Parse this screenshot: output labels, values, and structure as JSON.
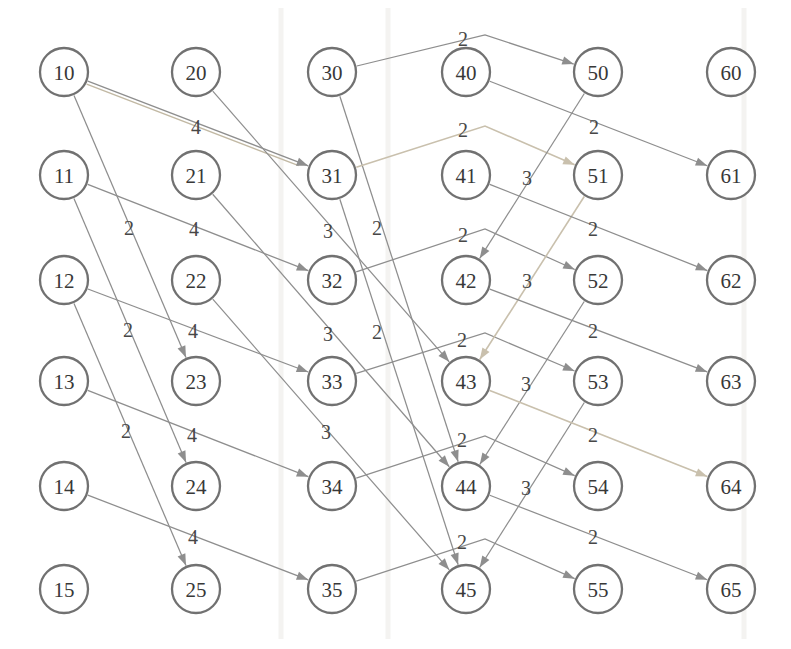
{
  "canvas": {
    "width": 791,
    "height": 649,
    "background": "#ffffff"
  },
  "style": {
    "edge_color": "#8e8e8e",
    "highlight_color": "#c9c0ad",
    "double_strand_color": "#c2b9a4",
    "node_stroke": "#717171",
    "node_fill": "#ffffff",
    "node_text_color": "#383838",
    "edge_label_color": "#474747",
    "node_radius": 24
  },
  "graph": {
    "columns_x": [
      64,
      196,
      332,
      466,
      598,
      731
    ],
    "rows_y": [
      72,
      175,
      280,
      381,
      486,
      589
    ],
    "nodes": [
      {
        "id": "10"
      },
      {
        "id": "11"
      },
      {
        "id": "12"
      },
      {
        "id": "13"
      },
      {
        "id": "14"
      },
      {
        "id": "15"
      },
      {
        "id": "20"
      },
      {
        "id": "21"
      },
      {
        "id": "22"
      },
      {
        "id": "23"
      },
      {
        "id": "24"
      },
      {
        "id": "25"
      },
      {
        "id": "30"
      },
      {
        "id": "31"
      },
      {
        "id": "32"
      },
      {
        "id": "33"
      },
      {
        "id": "34"
      },
      {
        "id": "35"
      },
      {
        "id": "40"
      },
      {
        "id": "41"
      },
      {
        "id": "42"
      },
      {
        "id": "43"
      },
      {
        "id": "44"
      },
      {
        "id": "45"
      },
      {
        "id": "50"
      },
      {
        "id": "51"
      },
      {
        "id": "52"
      },
      {
        "id": "53"
      },
      {
        "id": "54"
      },
      {
        "id": "55"
      },
      {
        "id": "60"
      },
      {
        "id": "61"
      },
      {
        "id": "62"
      },
      {
        "id": "63"
      },
      {
        "id": "64"
      },
      {
        "id": "65"
      }
    ],
    "edges": [
      {
        "from": "10",
        "to": "31",
        "w": "4",
        "label": [
          196,
          127
        ],
        "highlight": true,
        "double": true
      },
      {
        "from": "11",
        "to": "32",
        "w": "4",
        "label": [
          194,
          229
        ]
      },
      {
        "from": "12",
        "to": "33",
        "w": "4",
        "label": [
          193,
          331
        ]
      },
      {
        "from": "13",
        "to": "34",
        "w": "4",
        "label": [
          192,
          435
        ]
      },
      {
        "from": "14",
        "to": "35",
        "w": "4",
        "label": [
          193,
          537
        ]
      },
      {
        "from": "10",
        "to": "23",
        "w": "2",
        "label": [
          129,
          228
        ]
      },
      {
        "from": "11",
        "to": "24",
        "w": "2",
        "label": [
          128,
          330
        ]
      },
      {
        "from": "12",
        "to": "25",
        "w": "2",
        "label": [
          126,
          431
        ]
      },
      {
        "from": "20",
        "to": "43",
        "w": "3",
        "label": [
          328,
          231
        ]
      },
      {
        "from": "21",
        "to": "44",
        "w": "3",
        "label": [
          328,
          334
        ]
      },
      {
        "from": "22",
        "to": "45",
        "w": "3",
        "label": [
          326,
          432
        ]
      },
      {
        "from": "30",
        "to": "44",
        "w": "2",
        "label": [
          377,
          228
        ]
      },
      {
        "from": "31",
        "to": "45",
        "w": "2",
        "label": [
          377,
          332
        ]
      },
      {
        "from": "30",
        "to": "50",
        "w": "2",
        "label": [
          463,
          39
        ],
        "apex": [
          485,
          35
        ]
      },
      {
        "from": "31",
        "to": "51",
        "w": "2",
        "label": [
          463,
          130
        ],
        "apex": [
          485,
          126
        ],
        "highlight": true
      },
      {
        "from": "32",
        "to": "52",
        "w": "2",
        "label": [
          463,
          235
        ],
        "apex": [
          485,
          229
        ]
      },
      {
        "from": "33",
        "to": "53",
        "w": "2",
        "label": [
          462,
          340
        ],
        "apex": [
          485,
          333
        ]
      },
      {
        "from": "34",
        "to": "54",
        "w": "2",
        "label": [
          462,
          440
        ],
        "apex": [
          485,
          436
        ]
      },
      {
        "from": "35",
        "to": "55",
        "w": "2",
        "label": [
          462,
          542
        ],
        "apex": [
          485,
          539
        ]
      },
      {
        "from": "50",
        "to": "42",
        "w": "3",
        "label": [
          527,
          178
        ]
      },
      {
        "from": "51",
        "to": "43",
        "w": "3",
        "label": [
          527,
          281
        ],
        "highlight": true
      },
      {
        "from": "52",
        "to": "44",
        "w": "3",
        "label": [
          526,
          384
        ]
      },
      {
        "from": "53",
        "to": "45",
        "w": "3",
        "label": [
          526,
          488
        ]
      },
      {
        "from": "40",
        "to": "61",
        "w": "2",
        "label": [
          594,
          127
        ]
      },
      {
        "from": "41",
        "to": "62",
        "w": "2",
        "label": [
          593,
          229
        ]
      },
      {
        "from": "42",
        "to": "63",
        "w": "2",
        "label": [
          593,
          331
        ]
      },
      {
        "from": "43",
        "to": "64",
        "w": "2",
        "label": [
          593,
          435
        ],
        "highlight": true
      },
      {
        "from": "44",
        "to": "65",
        "w": "2",
        "label": [
          593,
          537
        ]
      }
    ]
  },
  "artifacts": {
    "vertical_lines_x": [
      281,
      388,
      744
    ]
  }
}
